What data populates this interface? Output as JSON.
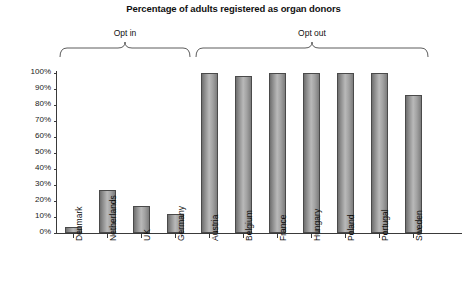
{
  "chart_data": {
    "type": "bar",
    "title": "Percentage of adults registered as organ donors",
    "xlabel": "",
    "ylabel": "Effective consent percentage",
    "ylim": [
      0,
      100
    ],
    "yticks": [
      "0%",
      "10%",
      "20%",
      "30%",
      "40%",
      "50%",
      "60%",
      "70%",
      "80%",
      "90%",
      "100%"
    ],
    "ytick_values": [
      0,
      10,
      20,
      30,
      40,
      50,
      60,
      70,
      80,
      90,
      100
    ],
    "grid": false,
    "legend": "none",
    "categories": [
      "Denmark",
      "Netherlands",
      "UK",
      "Germany",
      "Austria",
      "Belgium",
      "France",
      "Hungary",
      "Poland",
      "Portugal",
      "Sweden"
    ],
    "values": [
      4,
      27,
      17,
      12,
      100,
      98,
      100,
      100,
      100,
      100,
      86
    ],
    "annotations": [
      {
        "label": "Opt in",
        "covers": [
          "Denmark",
          "Netherlands",
          "UK",
          "Germany"
        ]
      },
      {
        "label": "Opt out",
        "covers": [
          "Austria",
          "Belgium",
          "France",
          "Hungary",
          "Poland",
          "Portugal",
          "Sweden"
        ]
      }
    ],
    "colors": {
      "bar_fill_light": "#b9b9b9",
      "bar_fill_dark": "#6f6f6f",
      "bar_stroke": "#4a4a4a",
      "axis": "#3a3a3a",
      "text": "#111111",
      "background": "#ffffff"
    }
  }
}
